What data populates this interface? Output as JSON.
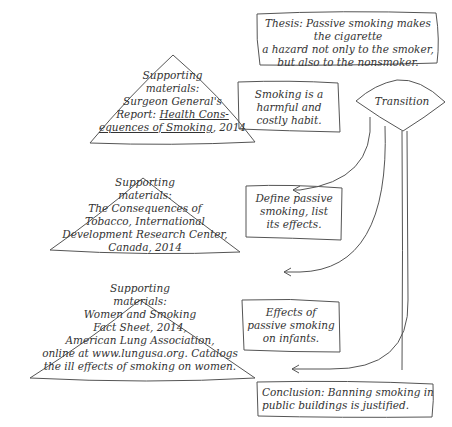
{
  "thesis": {
    "lines": [
      "Thesis: Passive smoking makes the cigarette",
      "a hazard not only to the smoker,",
      "but also to the nonsmoker."
    ]
  },
  "transition": {
    "label": "Transition"
  },
  "points": [
    {
      "lines": [
        "Smoking is a",
        "harmful and",
        "costly habit."
      ]
    },
    {
      "lines": [
        "Define passive",
        "smoking, list",
        "its effects."
      ]
    },
    {
      "lines": [
        "Effects of",
        "passive smoking",
        "on infants."
      ]
    }
  ],
  "supports": [
    {
      "lines": [
        "Supporting",
        "materials:",
        "Surgeon General's",
        "Report: ",
        "equences of Smoking",
        ", 2014"
      ],
      "title_part1": "Health Cons-",
      "title_part2": "equences of Smoking"
    },
    {
      "lines": [
        "Supporting",
        "materials:",
        "The Consequences of",
        "Tobacco, International",
        "Development Research Center,",
        "Canada, 2014"
      ]
    },
    {
      "lines": [
        "Supporting",
        "materials:",
        "Women and Smoking",
        "Fact Sheet, 2014,",
        "American Lung Association,",
        "online at www.lungusa.org. Catalogs",
        "the ill effects of smoking on women."
      ]
    }
  ],
  "conclusion": {
    "lines": [
      "Conclusion: Banning smoking in",
      "public buildings is justified."
    ]
  },
  "colors": {
    "stroke": "#555555",
    "text": "#333333",
    "background": "#ffffff"
  }
}
